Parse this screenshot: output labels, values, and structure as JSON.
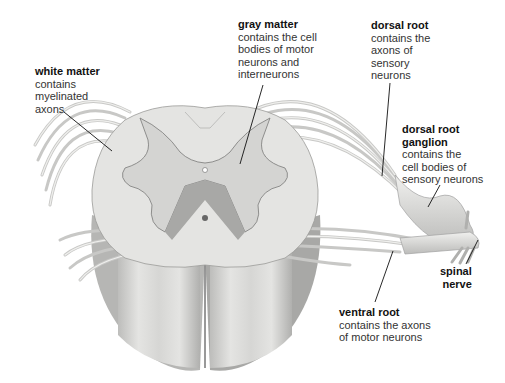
{
  "diagram": {
    "labels": [
      {
        "id": "white-matter",
        "title": "white matter",
        "desc": "contains\nmyelinated\naxons"
      },
      {
        "id": "gray-matter",
        "title": "gray matter",
        "desc": "contains the cell\nbodies of motor\nneurons and\ninterneurons"
      },
      {
        "id": "dorsal-root",
        "title": "dorsal root",
        "desc": "contains the\naxons of\nsensory\nneurons"
      },
      {
        "id": "dorsal-root-ganglion",
        "title": "dorsal root\nganglion",
        "desc": "contains the\ncell bodies of\nsensory neurons"
      },
      {
        "id": "spinal-nerve",
        "title": "spinal\nnerve",
        "desc": ""
      },
      {
        "id": "ventral-root",
        "title": "ventral root",
        "desc": "contains the axons\nof motor neurons"
      }
    ],
    "colors": {
      "background": "#ffffff",
      "white_matter": "#e6e6e4",
      "gray_matter": "#d2d2d0",
      "shadow": "#9a9a98",
      "nerve": "#dcdcda",
      "leader_line": "#111111"
    }
  }
}
